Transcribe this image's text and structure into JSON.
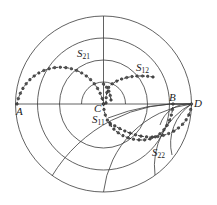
{
  "chart_data": {
    "type": "polar-diagram",
    "title": "",
    "grid": {
      "outer_radius": 1.0,
      "concentric_rings": [
        0.25,
        0.5,
        0.75,
        1.0
      ],
      "horizontal_diameter": true,
      "vertical_radius_upper": true,
      "lower_arcs_from_D": 6
    },
    "points": [
      {
        "label": "A",
        "position": "left end of horizontal diameter"
      },
      {
        "label": "B",
        "position": "right on horizontal axis, inside outer ring"
      },
      {
        "label": "C",
        "position": "chart center"
      },
      {
        "label": "D",
        "position": "right end of horizontal diameter"
      }
    ],
    "series": [
      {
        "name": "S21",
        "label_main": "S",
        "label_sub": "21",
        "path": "from A arcing over upper-left half to C"
      },
      {
        "name": "S12",
        "label_main": "S",
        "label_sub": "12",
        "path": "small arc from C rising to upper right"
      },
      {
        "name": "S11",
        "label_main": "S",
        "label_sub": "11",
        "path": "from C looping through lower half to B"
      },
      {
        "name": "S22",
        "label_main": "S",
        "label_sub": "22",
        "path": "from D curving down-left into lower half"
      }
    ]
  },
  "labels": {
    "A": "A",
    "B": "B",
    "C": "C",
    "D": "D",
    "s21_main": "S",
    "s21_sub": "21",
    "s12_main": "S",
    "s12_sub": "12",
    "s11_main": "S",
    "s11_sub": "11",
    "s22_main": "S",
    "s22_sub": "22"
  }
}
